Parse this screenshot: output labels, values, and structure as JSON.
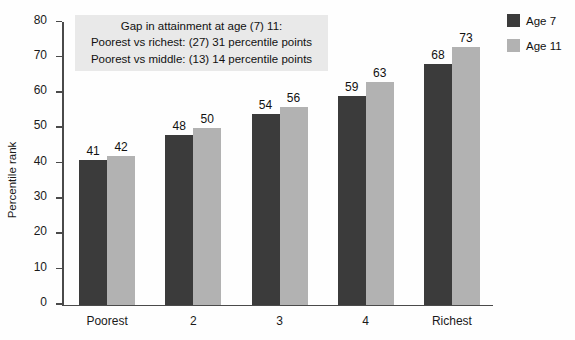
{
  "chart_data": {
    "type": "bar",
    "title": "",
    "xlabel": "",
    "ylabel": "Percentile rank",
    "ylim": [
      0,
      80
    ],
    "yticks": [
      0,
      10,
      20,
      30,
      40,
      50,
      60,
      70,
      80
    ],
    "grid": false,
    "legend_position": "right",
    "categories": [
      "Poorest",
      "2",
      "3",
      "4",
      "Richest"
    ],
    "series": [
      {
        "name": "Age 7",
        "color": "#3b3b3b",
        "values": [
          41,
          48,
          54,
          59,
          68
        ]
      },
      {
        "name": "Age 11",
        "color": "#b2b2b2",
        "values": [
          42,
          50,
          56,
          63,
          73
        ]
      }
    ],
    "annotations": [
      "Gap in attainment at age (7) 11:",
      "Poorest vs richest: (27) 31 percentile points",
      "Poorest vs middle: (13) 14 percentile points"
    ]
  }
}
